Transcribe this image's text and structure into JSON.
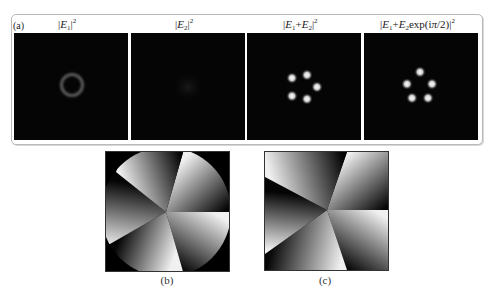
{
  "figure": {
    "panel_a": {
      "label": "(a)",
      "subpanels": [
        {
          "title_prefix": "|",
          "var1": "E",
          "sub1": "1",
          "rest": "|",
          "sup": "2",
          "display": "|E1|^2",
          "content": "ring"
        },
        {
          "title_prefix": "|",
          "var1": "E",
          "sub1": "2",
          "rest": "|",
          "sup": "2",
          "display": "|E2|^2",
          "content": "faint-blob"
        },
        {
          "display": "|E1+E2|^2",
          "content": "five-spots-rotated"
        },
        {
          "display": "|E1+E2exp(iπ/2)|^2",
          "content": "five-spots-upright"
        }
      ]
    },
    "panel_b": {
      "caption": "(b)",
      "content": "phase-pinwheel-circular"
    },
    "panel_c": {
      "caption": "(c)",
      "content": "phase-pinwheel-square"
    }
  },
  "titles": {
    "t1": {
      "v": "E",
      "s": "1",
      "p": "2"
    },
    "t2": {
      "v": "E",
      "s": "2",
      "p": "2"
    },
    "t3": {
      "v1": "E",
      "s1": "1",
      "op": "+",
      "v2": "E",
      "s2": "2",
      "p": "2"
    },
    "t4": {
      "v1": "E",
      "s1": "1",
      "op": "+",
      "v2": "E",
      "s2": "2",
      "fn": "exp(i",
      "pi": "π",
      "arg": "/2)",
      "p": "2"
    }
  },
  "colors": {
    "background": "#ffffff",
    "panel_bg": "#050505",
    "frame_border": "#b9b9b9",
    "ring": "#5a5a5a",
    "spot": "#ffffff"
  }
}
